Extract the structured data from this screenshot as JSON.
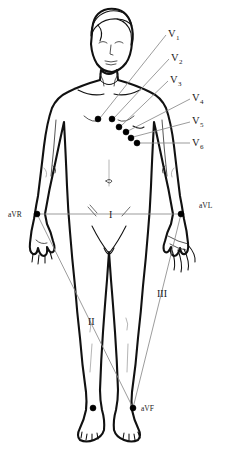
{
  "diagram": {
    "colors": {
      "outline": "#111111",
      "ribcage": "#b9b9b9",
      "leader_line": "#8a8a8a",
      "electrode": "#000000",
      "label_text": "#1a1a1a",
      "background": "#ffffff"
    }
  },
  "precordial_leads": [
    {
      "id": "V1",
      "label": "V",
      "subscript": "1",
      "label_x": 168,
      "label_y": 37,
      "sub_x": 176,
      "sub_y": 40,
      "dot_x": 98,
      "dot_y": 119,
      "leader_x1": 166,
      "leader_y1": 35,
      "leader_x2": 100,
      "leader_y2": 118
    },
    {
      "id": "V2",
      "label": "V",
      "subscript": "2",
      "label_x": 171,
      "label_y": 61,
      "sub_x": 179,
      "sub_y": 64,
      "dot_x": 112,
      "dot_y": 119,
      "leader_x1": 169,
      "leader_y1": 59,
      "leader_x2": 114,
      "leader_y2": 118
    },
    {
      "id": "V3",
      "label": "V",
      "subscript": "3",
      "label_x": 170,
      "label_y": 83,
      "sub_x": 178,
      "sub_y": 86,
      "dot_x": 119,
      "dot_y": 127,
      "leader_x1": 168,
      "leader_y1": 81,
      "leader_x2": 121,
      "leader_y2": 126
    },
    {
      "id": "V4",
      "label": "V",
      "subscript": "4",
      "label_x": 192,
      "label_y": 101,
      "sub_x": 200,
      "sub_y": 104,
      "dot_x": 126,
      "dot_y": 132,
      "leader_x1": 190,
      "leader_y1": 99,
      "leader_x2": 128,
      "leader_y2": 131
    },
    {
      "id": "V5",
      "label": "V",
      "subscript": "5",
      "label_x": 192,
      "label_y": 124,
      "sub_x": 200,
      "sub_y": 127,
      "dot_x": 131,
      "dot_y": 138,
      "leader_x1": 190,
      "leader_y1": 122,
      "leader_x2": 133,
      "leader_y2": 137
    },
    {
      "id": "V6",
      "label": "V",
      "subscript": "6",
      "label_x": 192,
      "label_y": 146,
      "sub_x": 200,
      "sub_y": 149,
      "dot_x": 137,
      "dot_y": 143,
      "leader_x1": 190,
      "leader_y1": 143,
      "leader_x2": 139,
      "leader_y2": 143
    }
  ],
  "limb_leads": [
    {
      "id": "aVR",
      "label": "aVR",
      "label_x": 8,
      "label_y": 217,
      "dot_x": 37,
      "dot_y": 214
    },
    {
      "id": "aVL",
      "label": "aVL",
      "label_x": 199,
      "label_y": 208,
      "dot_x": 181,
      "dot_y": 214
    },
    {
      "id": "aVF",
      "label": "aVF",
      "label_x": 141,
      "label_y": 411,
      "dot_x": 133,
      "dot_y": 408
    }
  ],
  "einthoven_leads": [
    {
      "id": "I",
      "label": "I",
      "label_x": 109,
      "label_y": 218,
      "from": "aVR",
      "to": "aVL"
    },
    {
      "id": "II",
      "label": "II",
      "label_x": 88,
      "label_y": 325,
      "from": "aVR",
      "to": "aVF"
    },
    {
      "id": "III",
      "label": "III",
      "label_x": 157,
      "label_y": 297,
      "from": "aVL",
      "to": "aVF"
    }
  ],
  "extra_electrode": {
    "id": "right-ankle",
    "dot_x": 93,
    "dot_y": 408
  }
}
